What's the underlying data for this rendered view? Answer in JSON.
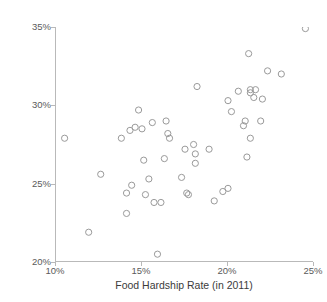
{
  "chart_data": {
    "type": "scatter",
    "title": "",
    "xlabel": "Food Hardship Rate (in 2011)",
    "ylabel": "Obesity Rate (in 2011)",
    "xlim": [
      10,
      25
    ],
    "ylim": [
      20,
      35
    ],
    "xticks": [
      "10%",
      "15%",
      "20%",
      "25%"
    ],
    "xtick_values": [
      10,
      15,
      20,
      25
    ],
    "yticks": [
      "20%",
      "25%",
      "30%",
      "35%"
    ],
    "ytick_values": [
      20,
      25,
      30,
      35
    ],
    "grid": false,
    "legend": null,
    "marker": "open-circle",
    "marker_color": "#9a9a9a",
    "points": [
      {
        "x": 10.5,
        "y": 27.9
      },
      {
        "x": 11.9,
        "y": 21.9
      },
      {
        "x": 12.6,
        "y": 25.6
      },
      {
        "x": 13.8,
        "y": 27.9
      },
      {
        "x": 14.1,
        "y": 24.4
      },
      {
        "x": 14.1,
        "y": 23.1
      },
      {
        "x": 14.3,
        "y": 28.4
      },
      {
        "x": 14.4,
        "y": 24.9
      },
      {
        "x": 14.6,
        "y": 28.6
      },
      {
        "x": 14.8,
        "y": 29.7
      },
      {
        "x": 15.0,
        "y": 28.5
      },
      {
        "x": 15.1,
        "y": 26.5
      },
      {
        "x": 15.2,
        "y": 24.3
      },
      {
        "x": 15.4,
        "y": 25.3
      },
      {
        "x": 15.6,
        "y": 28.9
      },
      {
        "x": 15.7,
        "y": 23.8
      },
      {
        "x": 15.9,
        "y": 20.5
      },
      {
        "x": 16.1,
        "y": 23.8
      },
      {
        "x": 16.3,
        "y": 26.6
      },
      {
        "x": 16.4,
        "y": 29.0
      },
      {
        "x": 16.5,
        "y": 28.2
      },
      {
        "x": 16.6,
        "y": 27.9
      },
      {
        "x": 17.3,
        "y": 25.4
      },
      {
        "x": 17.5,
        "y": 27.2
      },
      {
        "x": 17.6,
        "y": 24.4
      },
      {
        "x": 17.7,
        "y": 24.3
      },
      {
        "x": 18.0,
        "y": 27.5
      },
      {
        "x": 18.1,
        "y": 26.9
      },
      {
        "x": 18.1,
        "y": 26.3
      },
      {
        "x": 18.2,
        "y": 31.2
      },
      {
        "x": 18.9,
        "y": 27.2
      },
      {
        "x": 19.2,
        "y": 23.9
      },
      {
        "x": 19.7,
        "y": 24.5
      },
      {
        "x": 20.0,
        "y": 24.7
      },
      {
        "x": 20.0,
        "y": 30.3
      },
      {
        "x": 20.2,
        "y": 29.6
      },
      {
        "x": 20.6,
        "y": 30.9
      },
      {
        "x": 20.9,
        "y": 28.7
      },
      {
        "x": 21.0,
        "y": 29.0
      },
      {
        "x": 21.1,
        "y": 26.7
      },
      {
        "x": 21.2,
        "y": 33.3
      },
      {
        "x": 21.3,
        "y": 31.0
      },
      {
        "x": 21.3,
        "y": 30.8
      },
      {
        "x": 21.3,
        "y": 27.9
      },
      {
        "x": 21.5,
        "y": 30.5
      },
      {
        "x": 21.6,
        "y": 31.0
      },
      {
        "x": 21.9,
        "y": 29.0
      },
      {
        "x": 22.0,
        "y": 30.4
      },
      {
        "x": 22.3,
        "y": 32.2
      },
      {
        "x": 23.1,
        "y": 32.0
      },
      {
        "x": 24.5,
        "y": 34.9
      }
    ]
  }
}
